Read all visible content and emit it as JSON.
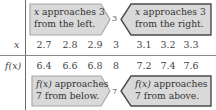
{
  "colors": {
    "box_fill": "#d9d9d9",
    "box_stroke_light": "#a8a8a8",
    "box_stroke_dark": "#4a4a4a",
    "text": "#3a3a3a",
    "rule": "#6a6a6a"
  },
  "top": {
    "left_box": {
      "var": "x",
      "line1_rest": " approaches 3",
      "line2": "from the left."
    },
    "center_value": "3",
    "right_box": {
      "var": "x",
      "line1_rest": " approaches 3",
      "line2": "from the right."
    }
  },
  "table": {
    "row_labels": [
      "x",
      "f(x)"
    ],
    "x_values": [
      "2.7",
      "2.8",
      "2.9",
      "3",
      "3.1",
      "3.2",
      "3.3"
    ],
    "fx_values": [
      "6.4",
      "6.6",
      "6.8",
      "8",
      "7.2",
      "7.4",
      "7.6"
    ]
  },
  "bottom": {
    "left_box": {
      "var": "f(x)",
      "line1_rest": " approaches",
      "line2": "7 from below."
    },
    "center_value": "7",
    "right_box": {
      "var": "f(x)",
      "line1_rest": " approaches",
      "line2": "7 from above."
    }
  }
}
